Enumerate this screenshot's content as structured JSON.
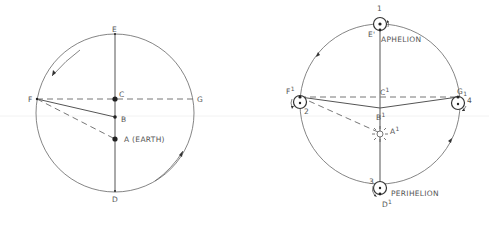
{
  "diagrams": {
    "left": {
      "title": "Geocentric eccentric orbit",
      "labels": {
        "E": "E",
        "F": "F",
        "G": "G",
        "C": "C",
        "B": "B",
        "A": "A (EARTH)",
        "D": "D"
      }
    },
    "right": {
      "title": "Heliocentric orbit with planet positions",
      "labels": {
        "pos1": "1",
        "E1": "E'",
        "aphelion": "APHELION",
        "F1": "F",
        "F1_sup": "1",
        "pos2": "2",
        "C1": "C",
        "C1_sup": "1",
        "G1": "G",
        "G1_sub": "1",
        "pos4": "4",
        "B1": "B",
        "B1_sup": "1",
        "A1": "A",
        "A1_sup": "1",
        "pos3": "3",
        "perihelion": "PERIHELION",
        "D1": "D",
        "D1_sup": "1"
      }
    }
  },
  "colors": {
    "line": "#555555",
    "background": "#ffffff",
    "point": "#222222"
  }
}
